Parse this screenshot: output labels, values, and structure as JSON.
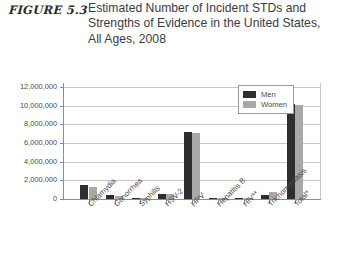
{
  "figure": {
    "number": "FIGURE 5.3",
    "title": "Estimated Number of Incident STDs and Strengths of Evidence in the United States, All Ages, 2008"
  },
  "legend": {
    "men_label": "Men",
    "women_label": "Women",
    "men_color": "#2e2e2e",
    "women_color": "#a8a8a8",
    "position": "top-right-inside"
  },
  "chart_data": {
    "type": "bar",
    "title": "Estimated Number of Incident STDs and Strengths of Evidence in the United States, All Ages, 2008",
    "xlabel": "",
    "ylabel": "",
    "ylim": [
      0,
      12000000
    ],
    "grid": true,
    "categories": [
      "Chlamydia",
      "Gonorrhea",
      "Syphilis",
      "HSV-2",
      "HPV",
      "Hepatitis B",
      "HIV**",
      "Trichomoniasis",
      "Total*"
    ],
    "ytick_labels": [
      "12,000,000",
      "10,000,000",
      "8,000,000",
      "6,000,000",
      "4,000,000",
      "2,000,000",
      "0"
    ],
    "ytick_values": [
      12000000,
      10000000,
      8000000,
      6000000,
      4000000,
      2000000,
      0
    ],
    "series": [
      {
        "name": "Men",
        "color": "#2e2e2e",
        "values": [
          1500000,
          400000,
          30000,
          500000,
          7200000,
          20000,
          30000,
          400000,
          10200000
        ]
      },
      {
        "name": "Women",
        "color": "#a8a8a8",
        "values": [
          1300000,
          300000,
          20000,
          500000,
          7100000,
          15000,
          15000,
          800000,
          10100000
        ]
      }
    ]
  }
}
